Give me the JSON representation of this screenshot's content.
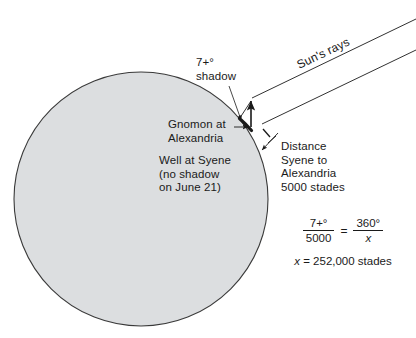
{
  "figure": {
    "earth_fill": "#dcdee0",
    "earth_stroke": "#3a3a3a",
    "line_color": "#1a1a1a"
  },
  "labels": {
    "shadow": "7+°\nshadow",
    "gnomon": "Gnomon at\nAlexandria",
    "well": "Well at Syene\n(no shadow\non June 21)",
    "distance": "Distance\nSyene to\nAlexandria\n5000 stades",
    "sun_rays": "Sun's rays"
  },
  "equation": {
    "left_numerator": "7+°",
    "left_denominator": "5000",
    "equals": "=",
    "right_numerator": "360°",
    "right_denominator": "x",
    "result_var": "x",
    "result_rest": " = 252,000 stades"
  },
  "geometry": {
    "earth_center_x": 141,
    "earth_center_y": 199,
    "earth_radius": 127,
    "gnomon_x": 251,
    "gnomon_top_y": 101,
    "gnomon_base_y": 127
  }
}
